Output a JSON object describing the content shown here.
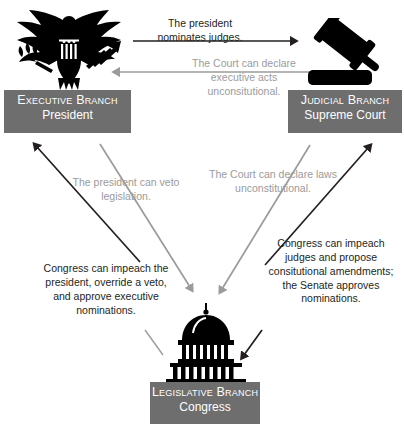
{
  "diagram": {
    "colors": {
      "box_fill": "#6e6e6e",
      "box_text": "#ffffff",
      "dark_text": "#231f20",
      "gray_text": "#9b9b9b",
      "dark_arrow": "#231f20",
      "gray_arrow": "#9b9b9b",
      "emblem": "#000000",
      "background": "#ffffff"
    },
    "branches": [
      {
        "id": "executive",
        "title": "Executive Branch",
        "subtitle": "President",
        "emblem": "eagle-seal-icon"
      },
      {
        "id": "judicial",
        "title": "Judicial Branch",
        "subtitle": "Supreme Court",
        "emblem": "gavel-icon"
      },
      {
        "id": "legislative",
        "title": "Legislative Branch",
        "subtitle": "Congress",
        "emblem": "capitol-dome-icon"
      }
    ],
    "annotations": [
      {
        "id": "nominates",
        "text": "The president\nnominates judges.",
        "style": "dark",
        "from": "executive",
        "to": "judicial"
      },
      {
        "id": "executive-acts",
        "text": "The Court can declare\nexecutive acts\nunconsitutional.",
        "style": "gray",
        "from": "judicial",
        "to": "executive"
      },
      {
        "id": "veto",
        "text": "The president can veto\nlegislation.",
        "style": "gray",
        "from": "executive",
        "to": "legislative"
      },
      {
        "id": "laws-unconstitutional",
        "text": "The Court can declare laws\nunconstitutional.",
        "style": "gray",
        "from": "judicial",
        "to": "legislative"
      },
      {
        "id": "impeach-president",
        "text": "Congress can impeach the\npresident, override a veto,\nand approve executive\nnominations.",
        "style": "dark",
        "from": "legislative",
        "to": "executive"
      },
      {
        "id": "impeach-judges",
        "text": "Congress can impeach\njudges and propose\nconsitutional amendments;\nthe Senate approves\nnominations.",
        "style": "dark",
        "from": "legislative",
        "to": "judicial"
      }
    ]
  }
}
